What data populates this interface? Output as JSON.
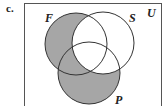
{
  "part_label": "c.",
  "diagram": {
    "type": "venn",
    "universe_label": "U",
    "sets": [
      {
        "name": "F",
        "label": "F"
      },
      {
        "name": "S",
        "label": "S"
      },
      {
        "name": "P",
        "label": "P"
      }
    ],
    "shaded_region": "(F ∪ P) − S",
    "shade_color": "#a6a6a6",
    "line_color": "#333333"
  }
}
